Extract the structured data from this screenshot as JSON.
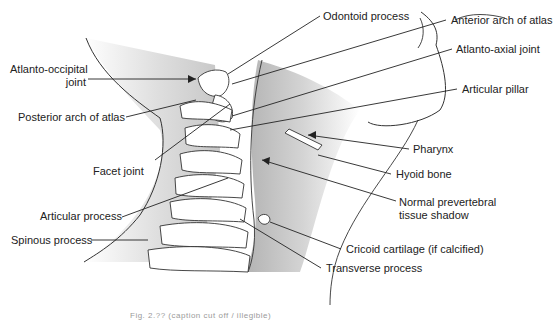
{
  "figure": {
    "type": "anatomical-diagram",
    "labels_left": [
      {
        "id": "atlanto-occipital",
        "text": "Atlanto-occipital",
        "text2": "joint"
      },
      {
        "id": "posterior-arch",
        "text": "Posterior arch of atlas"
      },
      {
        "id": "facet-joint",
        "text": "Facet joint"
      },
      {
        "id": "articular-process",
        "text": "Articular process"
      },
      {
        "id": "spinous-process",
        "text": "Spinous process"
      }
    ],
    "labels_right": [
      {
        "id": "odontoid",
        "text": "Odontoid process"
      },
      {
        "id": "anterior-arch",
        "text": "Anterior arch of atlas"
      },
      {
        "id": "atlanto-axial",
        "text": "Atlanto-axial joint"
      },
      {
        "id": "articular-pillar",
        "text": "Articular pillar"
      },
      {
        "id": "pharynx",
        "text": "Pharynx"
      },
      {
        "id": "hyoid",
        "text": "Hyoid bone"
      },
      {
        "id": "prevertebral",
        "text": "Normal prevertebral",
        "text2": "tissue shadow"
      },
      {
        "id": "cricoid",
        "text": "Cricoid cartilage (if calcified)"
      },
      {
        "id": "transverse",
        "text": "Transverse process"
      }
    ],
    "caption": "Fig. 2.?? (caption cut off / illegible)"
  }
}
